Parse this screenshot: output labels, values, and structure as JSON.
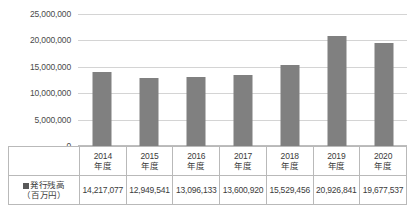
{
  "chart_data": {
    "type": "bar",
    "title": "",
    "xlabel": "",
    "ylabel": "",
    "categories": [
      "2014\n年度",
      "2015\n年度",
      "2016\n年度",
      "2017\n年度",
      "2018\n年度",
      "2019\n年度",
      "2020\n年度"
    ],
    "category_lines": [
      {
        "year": "2014",
        "suffix": "年度"
      },
      {
        "year": "2015",
        "suffix": "年度"
      },
      {
        "year": "2016",
        "suffix": "年度"
      },
      {
        "year": "2017",
        "suffix": "年度"
      },
      {
        "year": "2018",
        "suffix": "年度"
      },
      {
        "year": "2019",
        "suffix": "年度"
      },
      {
        "year": "2020",
        "suffix": "年度"
      }
    ],
    "series": [
      {
        "name": "発行残高（百万円）",
        "values": [
          14217077,
          12949541,
          13096133,
          13600920,
          15529456,
          20926841,
          19677537
        ],
        "value_labels": [
          "14,217,077",
          "12,949,541",
          "13,096,133",
          "13,600,920",
          "15,529,456",
          "20,926,841",
          "19,677,537"
        ],
        "color": "#808080"
      }
    ],
    "ylim": [
      0,
      25000000
    ],
    "yticks": [
      0,
      5000000,
      10000000,
      15000000,
      20000000,
      25000000
    ],
    "ytick_labels": [
      "0",
      "5,000,000",
      "10,000,000",
      "15,000,000",
      "20,000,000",
      "25,000,000"
    ],
    "grid": true,
    "legend_position": "table-row-header"
  },
  "table": {
    "row_label_line1": "発行残高",
    "row_label_line2": "（百万円）",
    "legend_marker": "legend-swatch"
  },
  "colors": {
    "bar": "#808080",
    "gridline": "#d4d4d4",
    "border": "#b9b9b9",
    "text": "#3b3b3b"
  }
}
